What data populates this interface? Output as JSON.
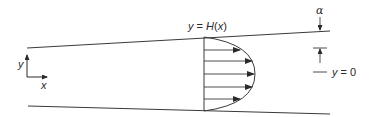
{
  "diagram": {
    "labels": {
      "upper_wall": "y = H(x)",
      "centerline": "y = 0",
      "angle": "α",
      "axis_x": "x",
      "axis_y": "y"
    },
    "walls": {
      "upper": {
        "x1": 27,
        "y1": 48,
        "x2": 330,
        "y2": 31
      },
      "lower": {
        "x1": 28,
        "y1": 106,
        "x2": 330,
        "y2": 114
      }
    },
    "profile": {
      "base_x": 204,
      "top_y": 37,
      "bottom_y": 111,
      "max_x": 255,
      "center_y": 74,
      "arrow_rows_y": [
        50,
        61,
        74,
        87,
        99
      ]
    },
    "colors": {
      "stroke": "#3a3a3a",
      "background": "#ffffff"
    }
  }
}
